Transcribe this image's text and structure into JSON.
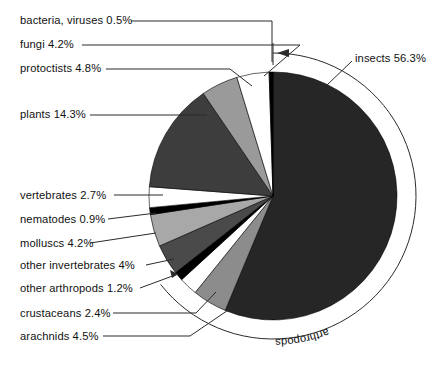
{
  "figure": {
    "title": "",
    "group_arc_label": "arthropods",
    "center": {
      "x": 273,
      "y": 196
    },
    "radius": 124,
    "ring_radius": 143
  },
  "chart_data": {
    "type": "pie",
    "title": "",
    "xlabel": "",
    "ylabel": "",
    "units": "%",
    "start_angle_deg": 0,
    "direction": "clockwise",
    "legend": "none",
    "labels_placement": "outside-with-leader-lines",
    "categories": [
      "insects",
      "arachnids",
      "crustaceans",
      "other arthropods",
      "other invertebrates",
      "molluscs",
      "nematodes",
      "vertebrates",
      "plants",
      "protoctists",
      "fungi",
      "bacteria, viruses"
    ],
    "values": [
      56.3,
      4.5,
      2.4,
      1.2,
      4.0,
      4.2,
      0.9,
      2.7,
      14.3,
      4.8,
      4.2,
      0.5
    ],
    "slice_labels": [
      "insects 56.3%",
      "arachnids 4.5%",
      "crustaceans 2.4%",
      "other arthropods 1.2%",
      "other invertebrates 4%",
      "molluscs 4.2%",
      "nematodes 0.9%",
      "vertebrates 2.7%",
      "plants 14.3%",
      "protoctists 4.8%",
      "fungi 4.2%",
      "bacteria, viruses 0.5%"
    ],
    "colors": [
      "#262626",
      "#8c8c8c",
      "#ffffff",
      "#000000",
      "#4a4a4a",
      "#a8a8a8",
      "#000000",
      "#ffffff",
      "#3d3d3d",
      "#9a9a9a",
      "#ffffff",
      "#000000"
    ],
    "group_annotation": {
      "label": "arthropods",
      "members": [
        "insects",
        "arachnids",
        "crustaceans",
        "other arthropods"
      ],
      "total": 64.4
    }
  },
  "labels": {
    "bacteria": "bacteria, viruses 0.5%",
    "fungi": "fungi 4.2%",
    "protoctists": "protoctists 4.8%",
    "plants": "plants 14.3%",
    "vertebrates": "vertebrates 2.7%",
    "nematodes": "nematodes 0.9%",
    "molluscs": "molluscs 4.2%",
    "other_invertebrates": "other invertebrates 4%",
    "other_arthropods": "other arthropods 1.2%",
    "crustaceans": "crustaceans 2.4%",
    "arachnids": "arachnids 4.5%",
    "insects": "insects 56.3%",
    "arthropods_arc": "arthropods"
  }
}
